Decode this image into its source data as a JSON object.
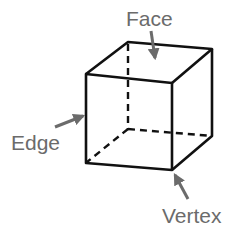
{
  "diagram": {
    "labels": {
      "face": "Face",
      "edge": "Edge",
      "vertex": "Vertex"
    },
    "colors": {
      "line": "#111111",
      "label": "#6b6b6b",
      "arrow": "#6b6b6b",
      "background": "#ffffff"
    },
    "cube": {
      "visible_edges": 9,
      "hidden_edges": 3
    }
  }
}
